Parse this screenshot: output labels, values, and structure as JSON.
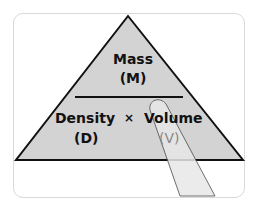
{
  "triangle": {
    "top_label": "Mass",
    "top_symbol": "(M)",
    "bottom_left_label": "Density",
    "operator": "×",
    "bottom_right_label": "Volume",
    "bottom_left_symbol": "(D)",
    "bottom_right_symbol": "(V)"
  },
  "colors": {
    "triangle_fill": "#d3d3d3",
    "stroke": "#111111",
    "finger_fill": "#e6e6e6"
  }
}
